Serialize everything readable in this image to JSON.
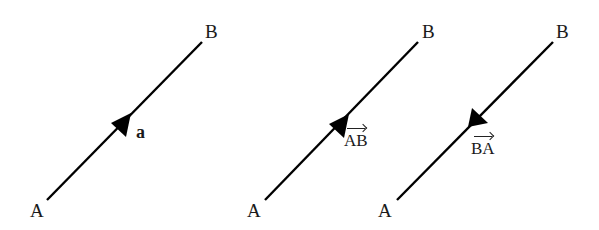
{
  "diagrams": [
    {
      "id": "vector-a",
      "start_label": "A",
      "end_label": "B",
      "vector_label": "a",
      "vector_label_style": "bold",
      "direction": "A-to-B"
    },
    {
      "id": "vector-AB",
      "start_label": "A",
      "end_label": "B",
      "vector_label": "AB",
      "vector_label_style": "overarrow",
      "direction": "A-to-B"
    },
    {
      "id": "vector-BA",
      "start_label": "A",
      "end_label": "B",
      "vector_label": "BA",
      "vector_label_style": "overarrow",
      "direction": "B-to-A"
    }
  ],
  "colors": {
    "line": "#000000",
    "text": "#1a1a1a",
    "background": "#ffffff"
  }
}
